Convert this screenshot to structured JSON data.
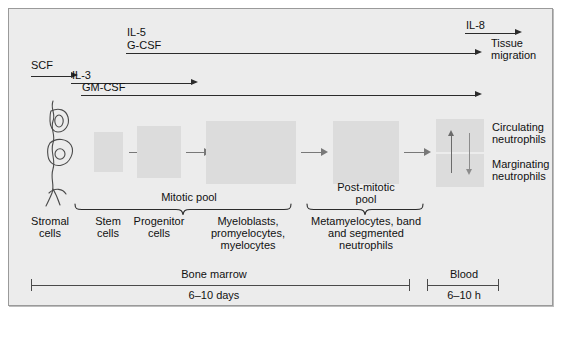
{
  "figure": {
    "background_color": "#ececec",
    "box_fill_color": "#dcdcdc",
    "line_color": "#2b2b2b"
  },
  "growth_factors": [
    {
      "id": "scf",
      "label": "SCF",
      "underlined": false,
      "arrow": "short"
    },
    {
      "id": "il3",
      "label": "IL-3",
      "underlined": true,
      "arrow": "medium"
    },
    {
      "id": "gmcsf",
      "label": "GM-CSF",
      "underlined": true,
      "arrow": "long"
    },
    {
      "id": "il5",
      "label": "IL-5",
      "underlined": false,
      "arrow": "none"
    },
    {
      "id": "gcsf",
      "label": "G-CSF",
      "underlined": true,
      "arrow": "long"
    },
    {
      "id": "il8",
      "label": "IL-8",
      "underlined": true,
      "arrow": "short"
    }
  ],
  "outcome": {
    "line1": "Tissue",
    "line2": "migration"
  },
  "stages": [
    {
      "id": "stromal",
      "label_lines": [
        "Stromal",
        "cells"
      ]
    },
    {
      "id": "stem",
      "label_lines": [
        "Stem",
        "cells"
      ]
    },
    {
      "id": "progenitor",
      "label_lines": [
        "Progenitor",
        "cells"
      ]
    },
    {
      "id": "myeloblasts",
      "label_lines": [
        "Myeloblasts,",
        "promyelocytes,",
        "myelocytes"
      ]
    },
    {
      "id": "metamyelocytes",
      "label_lines": [
        "Metamyelocytes, band",
        "and segmented",
        "neutrophils"
      ]
    }
  ],
  "pools": [
    {
      "id": "mitotic",
      "label_lines": [
        "Mitotic pool"
      ]
    },
    {
      "id": "post_mitotic",
      "label_lines": [
        "Post-mitotic",
        "pool"
      ]
    }
  ],
  "blood_compartments": [
    {
      "id": "circulating",
      "line1": "Circulating",
      "line2": "neutrophils"
    },
    {
      "id": "marginating",
      "line1": "Marginating",
      "line2": "neutrophils"
    }
  ],
  "timeline": [
    {
      "id": "bone_marrow",
      "label": "Bone marrow",
      "duration": "6–10 days"
    },
    {
      "id": "blood",
      "label": "Blood",
      "duration": "6–10 h"
    }
  ]
}
